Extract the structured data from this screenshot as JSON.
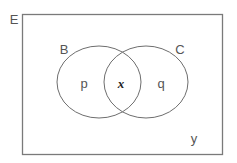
{
  "diagram": {
    "type": "venn",
    "universal_set": {
      "label": "E"
    },
    "sets": [
      {
        "id": "B",
        "label": "B"
      },
      {
        "id": "C",
        "label": "C"
      }
    ],
    "regions": {
      "B_only": "p",
      "B_and_C": "x",
      "C_only": "q",
      "outside": "y"
    },
    "colors": {
      "stroke": "#7a7a7a",
      "text": "#555555",
      "background": "#ffffff"
    }
  }
}
